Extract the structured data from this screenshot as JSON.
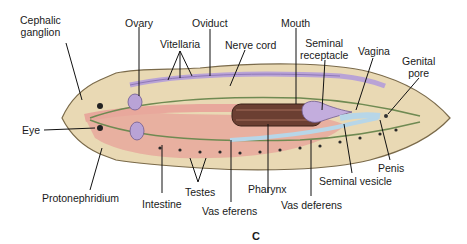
{
  "figure": {
    "panel_letter": "C",
    "colors": {
      "body": "#e9d9b4",
      "body_outline": "#7a6a4a",
      "intestine": "#e8a89c",
      "vitellaria": "#b9a3d6",
      "nerve": "#6f8a52",
      "seminal_vesicle": "#b7d6e8",
      "pharynx": "#6b3f32",
      "leader": "#111111"
    }
  },
  "labels": {
    "cephalic_ganglion": [
      "Cephalic",
      "ganglion"
    ],
    "ovary": "Ovary",
    "oviduct": "Oviduct",
    "vitellaria": "Vitellaria",
    "nerve_cord": "Nerve cord",
    "mouth": "Mouth",
    "seminal_receptacle": [
      "Seminal",
      "receptacle"
    ],
    "vagina": "Vagina",
    "genital_pore": [
      "Genital",
      "pore"
    ],
    "eye": "Eye",
    "protonephridium": "Protonephridium",
    "intestine": "Intestine",
    "testes": "Testes",
    "vas_eferens": "Vas eferens",
    "pharynx": "Pharynx",
    "vas_deferens": "Vas deferens",
    "seminal_vesicle": "Seminal vesicle",
    "penis": "Penis"
  }
}
